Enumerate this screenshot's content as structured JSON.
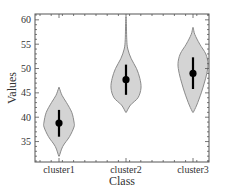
{
  "chart_data": {
    "type": "violin",
    "title": "",
    "xlabel": "Class",
    "ylabel": "Values",
    "categories": [
      "cluster1",
      "cluster2",
      "cluster3"
    ],
    "ylim": [
      30.8,
      61.2
    ],
    "yticks": [
      35,
      40,
      45,
      50,
      55,
      60
    ],
    "grid": false,
    "legend": null,
    "series": [
      {
        "name": "cluster1",
        "min": 32,
        "max": 46,
        "median": 38.8,
        "q1": 36,
        "q3": 41.5,
        "profile": [
          [
            32,
            0.02
          ],
          [
            34,
            0.25
          ],
          [
            36,
            0.7
          ],
          [
            38,
            1.0
          ],
          [
            39,
            1.0
          ],
          [
            41,
            0.85
          ],
          [
            43,
            0.5
          ],
          [
            44.5,
            0.2
          ],
          [
            46,
            0.02
          ]
        ]
      },
      {
        "name": "cluster2",
        "min": 41,
        "max": 60,
        "median": 47.7,
        "q1": 44.6,
        "q3": 50.8,
        "profile": [
          [
            41,
            0.02
          ],
          [
            42.5,
            0.3
          ],
          [
            44,
            0.8
          ],
          [
            46,
            1.0
          ],
          [
            48,
            0.92
          ],
          [
            50,
            0.7
          ],
          [
            52,
            0.35
          ],
          [
            54,
            0.12
          ],
          [
            56,
            0.05
          ],
          [
            60,
            0.02
          ]
        ]
      },
      {
        "name": "cluster3",
        "min": 41,
        "max": 58.3,
        "median": 49,
        "q1": 45.8,
        "q3": 52.3,
        "profile": [
          [
            41,
            0.02
          ],
          [
            42.5,
            0.25
          ],
          [
            45,
            0.55
          ],
          [
            47,
            0.75
          ],
          [
            49,
            0.92
          ],
          [
            51,
            1.0
          ],
          [
            53,
            0.85
          ],
          [
            55,
            0.45
          ],
          [
            57,
            0.12
          ],
          [
            58.3,
            0.02
          ]
        ]
      }
    ],
    "colors": {
      "fill": "#d4d4d4",
      "outline": "#8a8a8a",
      "marker": "#000000",
      "axis": "#555555"
    }
  }
}
